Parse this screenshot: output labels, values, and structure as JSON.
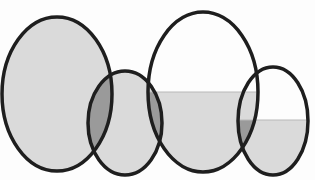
{
  "diagram": {
    "type": "overlapping-ellipses",
    "width": 315,
    "height": 180,
    "background": "#fdfdfd",
    "stroke_color": "#1e1e1e",
    "stroke_width": 3.5,
    "light_fill": "#dadada",
    "overlap_fill": "#8e8e8e",
    "ellipses": [
      {
        "id": "A",
        "cx": 57,
        "cy": 94,
        "rx": 55,
        "ry": 77,
        "fill_level_y": 0
      },
      {
        "id": "B",
        "cx": 125,
        "cy": 123,
        "rx": 37,
        "ry": 52,
        "fill_level_y": 0
      },
      {
        "id": "C",
        "cx": 203,
        "cy": 92,
        "rx": 55,
        "ry": 80,
        "fill_level_y": 92
      },
      {
        "id": "D",
        "cx": 273,
        "cy": 121,
        "rx": 35,
        "ry": 54,
        "fill_level_y": 120
      }
    ]
  }
}
